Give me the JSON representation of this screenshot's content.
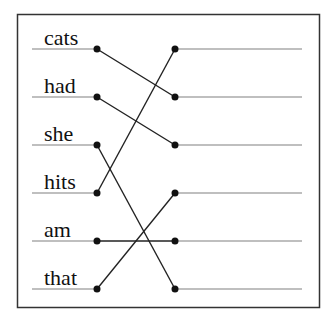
{
  "diagram": {
    "type": "matching-exercise",
    "left_words": [
      "cats",
      "had",
      "she",
      "hits",
      "am",
      "that"
    ],
    "right_slots": [
      "",
      "",
      "",
      "",
      "",
      ""
    ],
    "connections": [
      {
        "from": "cats",
        "left_index": 0,
        "right_index": 1
      },
      {
        "from": "had",
        "left_index": 1,
        "right_index": 2
      },
      {
        "from": "she",
        "left_index": 2,
        "right_index": 5
      },
      {
        "from": "hits",
        "left_index": 3,
        "right_index": 0
      },
      {
        "from": "am",
        "left_index": 4,
        "right_index": 4
      },
      {
        "from": "that",
        "left_index": 5,
        "right_index": 3
      }
    ]
  },
  "colors": {
    "frame": "#333333",
    "line": "#808080",
    "connector": "#222222",
    "dot": "#111111",
    "text": "#111111"
  }
}
